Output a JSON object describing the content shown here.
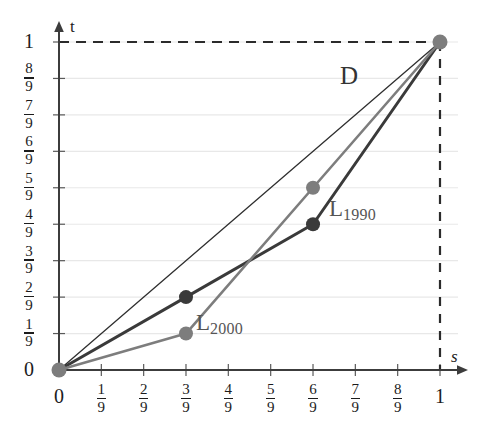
{
  "chart_data": {
    "type": "line",
    "title": "",
    "xlabel": "s",
    "ylabel": "t",
    "xlim": [
      0,
      1
    ],
    "ylim": [
      0,
      1
    ],
    "grid": true,
    "legend_position": "inline-annotations",
    "x_tick_labels": [
      "0",
      "1/9",
      "2/9",
      "3/9",
      "4/9",
      "5/9",
      "6/9",
      "7/9",
      "8/9",
      "1"
    ],
    "y_tick_labels": [
      "0",
      "1/9",
      "2/9",
      "3/9",
      "4/9",
      "5/9",
      "6/9",
      "7/9",
      "8/9",
      "1"
    ],
    "x_tick_values": [
      0,
      0.1111,
      0.2222,
      0.3333,
      0.4444,
      0.5556,
      0.6667,
      0.7778,
      0.8889,
      1
    ],
    "y_tick_values": [
      0,
      0.1111,
      0.2222,
      0.3333,
      0.4444,
      0.5556,
      0.6667,
      0.7778,
      0.8889,
      1
    ],
    "series": [
      {
        "name": "D",
        "label": "D",
        "color": "#2f2f2f",
        "width": 1.3,
        "markers": false,
        "x": [
          0,
          1
        ],
        "y": [
          0,
          1
        ]
      },
      {
        "name": "L_1990",
        "label": "L",
        "label_sub": "1990",
        "color": "#3a3a3a",
        "width": 3.0,
        "markers": true,
        "marker_color": "#3a3a3a",
        "x": [
          0,
          0.3333,
          0.6667,
          1
        ],
        "y": [
          0,
          0.2222,
          0.4444,
          1
        ]
      },
      {
        "name": "L_2000",
        "label": "L",
        "label_sub": "2000",
        "color": "#7d7d7d",
        "width": 2.6,
        "markers": true,
        "marker_color": "#7d7d7d",
        "x": [
          0,
          0.3333,
          0.6667,
          1
        ],
        "y": [
          0,
          0.1111,
          0.5556,
          1
        ]
      }
    ],
    "reference_lines": [
      {
        "name": "t-equals-one",
        "orientation": "horizontal",
        "value": 1,
        "style": "dashed",
        "color": "#2b2b2b"
      },
      {
        "name": "s-equals-one",
        "orientation": "vertical",
        "value": 1,
        "style": "dashed",
        "color": "#2b2b2b"
      }
    ],
    "endpoint_marker": {
      "x": 1,
      "y": 1,
      "color": "#7d7d7d"
    },
    "origin_marker": {
      "x": 0,
      "y": 0,
      "color": "#7d7d7d"
    },
    "colors": {
      "grid": "#e8e8e8",
      "axis": "#3c3c3c",
      "text": "#1c1c1c",
      "curve_label": "#555555"
    }
  },
  "annotations": {
    "d_label": "D",
    "l1990_main": "L",
    "l1990_sub": "1990",
    "l2000_main": "L",
    "l2000_sub": "2000",
    "axis_x": "s",
    "axis_y": "t"
  },
  "ticks": {
    "x": [
      {
        "text": "0",
        "kind": "whole"
      },
      {
        "num": "1",
        "den": "9",
        "kind": "frac"
      },
      {
        "num": "2",
        "den": "9",
        "kind": "frac"
      },
      {
        "num": "3",
        "den": "9",
        "kind": "frac"
      },
      {
        "num": "4",
        "den": "9",
        "kind": "frac"
      },
      {
        "num": "5",
        "den": "9",
        "kind": "frac"
      },
      {
        "num": "6",
        "den": "9",
        "kind": "frac"
      },
      {
        "num": "7",
        "den": "9",
        "kind": "frac"
      },
      {
        "num": "8",
        "den": "9",
        "kind": "frac"
      },
      {
        "text": "1",
        "kind": "whole"
      }
    ],
    "y": [
      {
        "text": "0",
        "kind": "whole"
      },
      {
        "num": "1",
        "den": "9",
        "kind": "frac"
      },
      {
        "num": "2",
        "den": "9",
        "kind": "frac"
      },
      {
        "num": "3",
        "den": "9",
        "kind": "frac"
      },
      {
        "num": "4",
        "den": "9",
        "kind": "frac"
      },
      {
        "num": "5",
        "den": "9",
        "kind": "frac"
      },
      {
        "num": "6",
        "den": "9",
        "kind": "frac"
      },
      {
        "num": "7",
        "den": "9",
        "kind": "frac"
      },
      {
        "num": "8",
        "den": "9",
        "kind": "frac"
      },
      {
        "text": "1",
        "kind": "whole"
      }
    ]
  }
}
